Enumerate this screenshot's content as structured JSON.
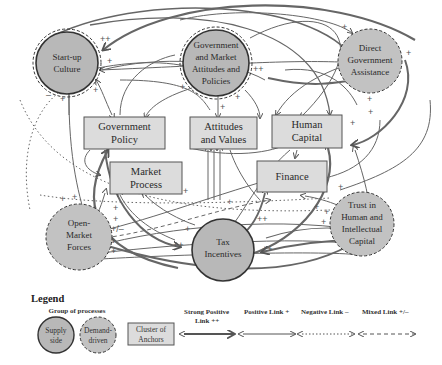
{
  "diagram": {
    "supply_nodes": [
      {
        "id": "startup",
        "lines": [
          "Start-up",
          "Culture"
        ]
      },
      {
        "id": "govmarket",
        "lines": [
          "Government",
          "and Market",
          "Attitudes and",
          "Policies"
        ]
      },
      {
        "id": "tax",
        "lines": [
          "Tax",
          "Incentives"
        ]
      }
    ],
    "demand_nodes": [
      {
        "id": "direct",
        "lines": [
          "Direct",
          "Government",
          "Assistance"
        ]
      },
      {
        "id": "openmarket",
        "lines": [
          "Open-",
          "Market",
          "Forces"
        ]
      },
      {
        "id": "trust",
        "lines": [
          "Trust in",
          "Human and",
          "Intellectual",
          "Capital"
        ]
      }
    ],
    "anchors": [
      {
        "id": "govpolicy",
        "lines": [
          "Government",
          "Policy"
        ]
      },
      {
        "id": "attitudes",
        "lines": [
          "Attitudes",
          "and Values"
        ]
      },
      {
        "id": "humancap",
        "lines": [
          "Human",
          "Capital"
        ]
      },
      {
        "id": "market",
        "lines": [
          "Market",
          "Process"
        ]
      },
      {
        "id": "finance",
        "lines": [
          "Finance"
        ]
      }
    ],
    "signs": {
      "pp": "++",
      "p": "+",
      "m": "–",
      "pm": "+/–"
    }
  },
  "legend": {
    "title": "Legend",
    "group_label": "Group of processes",
    "supply": [
      "Supply",
      "side"
    ],
    "demand": [
      "Demand-",
      "driven"
    ],
    "cluster": [
      "Cluster of",
      "Anchors"
    ],
    "strong_positive": [
      "Strong Positive",
      "Link ++"
    ],
    "positive": "Positive Link +",
    "negative": "Negative Link –",
    "mixed": "Mixed Link +/–"
  },
  "colors": {
    "node_fill": "#b8b8b8",
    "box_fill": "#dcdcdc",
    "stroke": "#444444",
    "arrow": "#555555"
  }
}
